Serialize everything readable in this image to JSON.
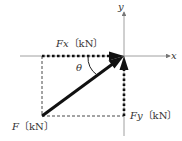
{
  "diagram": {
    "labels": {
      "x_axis": "x",
      "y_axis": "y",
      "fx": "Fx",
      "fy": "Fy",
      "f": "F",
      "unit": "〔kN〕",
      "angle": "θ"
    },
    "colors": {
      "axis": "#777777",
      "vector": "#111111",
      "dashed": "#333333"
    }
  }
}
